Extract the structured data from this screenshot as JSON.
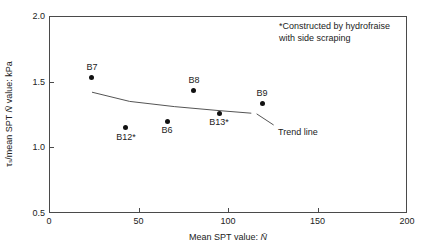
{
  "figure": {
    "annotation": {
      "line1": "*Constructed by hydrofraise",
      "line2": "with side scraping"
    },
    "y_axis": {
      "prefix": "τₛ/mean SPT ",
      "nbar": "N̄",
      "suffix": " value: kPa"
    },
    "x_axis": {
      "prefix": "Mean SPT value: ",
      "nbar": "N̄"
    },
    "colors": {
      "axis": "#4a4a4a",
      "text": "#222222",
      "point": "#111111",
      "trend": "#555555"
    }
  },
  "chart_data": {
    "type": "scatter",
    "title": "",
    "xlabel": "Mean SPT value: N̄",
    "ylabel": "τₛ/mean SPT N̄ value: kPa",
    "xlim": [
      0,
      200
    ],
    "ylim": [
      0.5,
      2.0
    ],
    "x_ticks": [
      0,
      50,
      100,
      150,
      200
    ],
    "x_tick_labels": [
      "0",
      "50",
      "100",
      "150",
      "200"
    ],
    "y_ticks": [
      0.5,
      1.0,
      1.5,
      2.0
    ],
    "y_tick_labels": [
      "0.5",
      "1.0",
      "1.5",
      "2.0"
    ],
    "grid": false,
    "legend": "none",
    "points": [
      {
        "label": "B7",
        "x": 24,
        "y": 1.53,
        "label_position": "above"
      },
      {
        "label": "B12*",
        "x": 43,
        "y": 1.15,
        "label_position": "below"
      },
      {
        "label": "B6",
        "x": 66,
        "y": 1.2,
        "label_position": "below"
      },
      {
        "label": "B8",
        "x": 81,
        "y": 1.43,
        "label_position": "above"
      },
      {
        "label": "B13*",
        "x": 95,
        "y": 1.26,
        "label_position": "below"
      },
      {
        "label": "B9",
        "x": 119,
        "y": 1.33,
        "label_position": "above"
      }
    ],
    "trend_line": {
      "label": "Trend line",
      "points": [
        [
          24,
          1.42
        ],
        [
          45,
          1.35
        ],
        [
          70,
          1.31
        ],
        [
          95,
          1.28
        ],
        [
          113,
          1.26
        ]
      ],
      "leader": [
        [
          116,
          1.255
        ],
        [
          125.5,
          1.17
        ]
      ],
      "label_anchor": [
        128,
        1.12
      ]
    },
    "annotation": "*Constructed by hydrofraise with side scraping"
  }
}
